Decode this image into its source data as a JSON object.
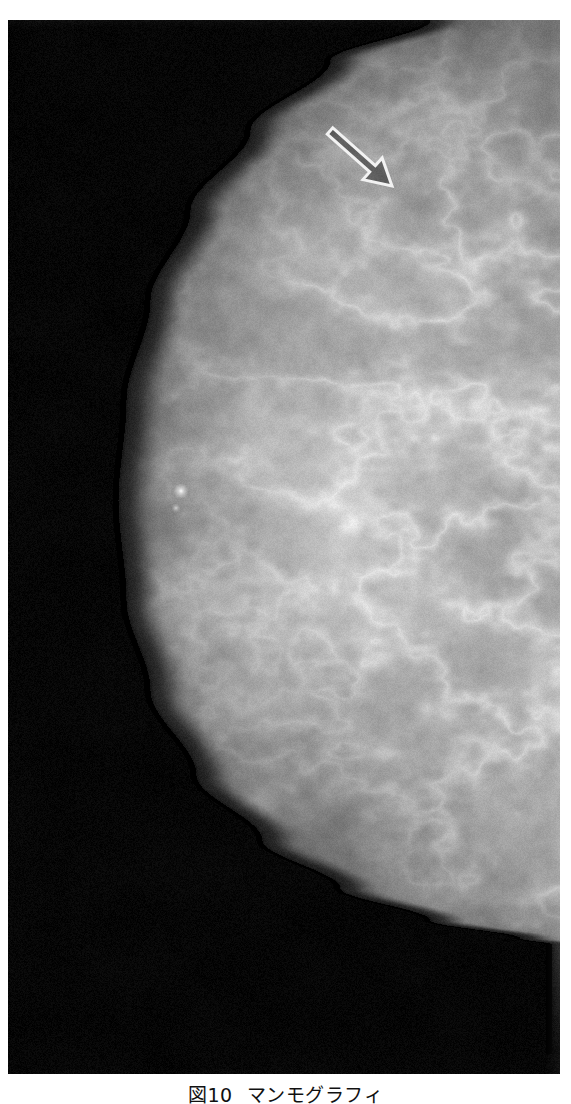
{
  "page": {
    "background_color": "#ffffff",
    "figure_plate": {
      "x": 8,
      "y": 20,
      "width": 552,
      "height": 1054,
      "background_color": "#000000",
      "modality_label": "mammogram"
    }
  },
  "caption": {
    "figure_number": "図10",
    "title": "マンモグラフィ",
    "full_text": "図10  マンモグラフィ",
    "color": "#111111"
  },
  "annotations": [
    {
      "name": "lesion-arrow",
      "type": "open-outline-arrow",
      "color": "#ffffff",
      "outline_color": "#f2f2f2",
      "direction": "down-right",
      "tail_x": 330,
      "tail_y": 131,
      "tip_x": 392,
      "tip_y": 186,
      "points_to": "spiculated-mass-upper-breast"
    }
  ],
  "chart_data": {
    "type": "heatmap",
    "xlabel": "",
    "ylabel": "",
    "colorscale": [
      "#000000",
      "#3a3a3a",
      "#7a7a7a",
      "#b4b4b4",
      "#e8e8e8"
    ],
    "grid": false,
    "legend_position": "none",
    "regions": [
      {
        "name": "background-air",
        "gray": 4,
        "area_fraction": 0.42
      },
      {
        "name": "skin-line-anterior-edge",
        "gray": 30,
        "area_fraction": 0.03
      },
      {
        "name": "subcutaneous-fat",
        "gray": 95,
        "area_fraction": 0.12
      },
      {
        "name": "fibroglandular-tissue",
        "gray": 165,
        "area_fraction": 0.26
      },
      {
        "name": "dense-glandular-core",
        "gray": 205,
        "area_fraction": 0.09
      },
      {
        "name": "retroglandular-fat-lucency",
        "gray": 60,
        "area_fraction": 0.06
      },
      {
        "name": "pectoral-muscle-band",
        "gray": 120,
        "area_fraction": 0.02
      }
    ],
    "contour_points": [
      [
        430,
        20
      ],
      [
        330,
        60
      ],
      [
        250,
        130
      ],
      [
        190,
        210
      ],
      [
        150,
        300
      ],
      [
        126,
        400
      ],
      [
        118,
        500
      ],
      [
        126,
        600
      ],
      [
        150,
        690
      ],
      [
        196,
        775
      ],
      [
        262,
        840
      ],
      [
        340,
        888
      ],
      [
        430,
        920
      ],
      [
        520,
        938
      ],
      [
        552,
        944
      ]
    ],
    "bright_markers": [
      {
        "name": "microcalcification",
        "x": 181,
        "y": 491,
        "radius": 2.4,
        "gray": 252
      },
      {
        "name": "microcalcification",
        "x": 176,
        "y": 508,
        "radius": 1.4,
        "gray": 210
      }
    ]
  }
}
